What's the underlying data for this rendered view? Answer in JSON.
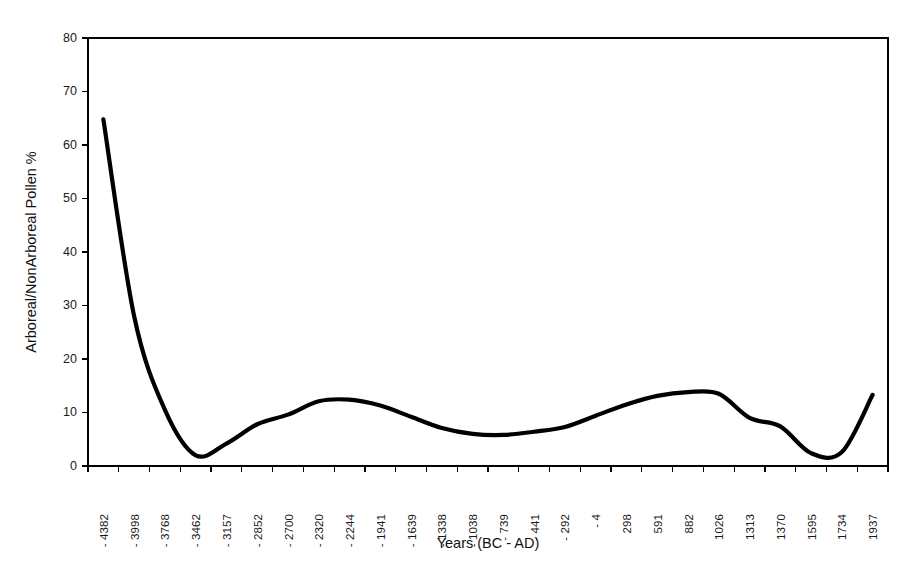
{
  "chart_data": {
    "type": "line",
    "title": "",
    "xlabel": "Years (BC - AD)",
    "ylabel": "Arboreal/NonArboreal Pollen %",
    "ylim": [
      0,
      80
    ],
    "yticks": [
      0,
      10,
      20,
      30,
      40,
      50,
      60,
      70,
      80
    ],
    "ytick_labels": [
      "0",
      "10",
      "20",
      "30",
      "40",
      "50",
      "60",
      "70",
      "80"
    ],
    "grid": false,
    "legend": "none",
    "line_color": "#000000",
    "categories": [
      "-4382",
      "-3998",
      "-3768",
      "-3462",
      "-3157",
      "-2852",
      "-2700",
      "-2320",
      "-2244",
      "-1941",
      "-1639",
      "-1338",
      "-1038",
      "-739",
      "-441",
      "-292",
      "-4",
      "298",
      "591",
      "882",
      "1026",
      "1313",
      "1370",
      "1595",
      "1734",
      "1937"
    ],
    "values": [
      64.8,
      28.0,
      10.5,
      2.0,
      4.2,
      7.8,
      9.6,
      12.1,
      12.4,
      11.3,
      9.2,
      7.1,
      6.0,
      5.8,
      6.4,
      7.3,
      9.4,
      11.5,
      13.1,
      13.8,
      13.5,
      9.0,
      7.4,
      2.4,
      2.6,
      13.3
    ],
    "series_name": "Arboreal/NonArboreal Pollen %",
    "annotations": {
      "start_value": 64.8,
      "first_minimum": {
        "category": "-3462",
        "value": 1.6
      },
      "first_local_peak": {
        "category": "-2244",
        "value": 12.4
      },
      "mid_minimum": {
        "category": "-739",
        "value": 5.8
      },
      "main_peak": {
        "category": "882",
        "value": 13.8
      },
      "late_minimum": {
        "category": "1595",
        "value": 2.2
      },
      "end_value": 13.3
    }
  }
}
